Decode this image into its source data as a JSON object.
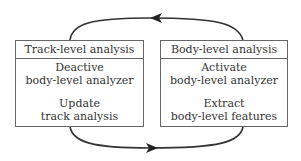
{
  "diagram": {
    "left_box": {
      "title": "Track-level analysis",
      "steps": [
        {
          "line1": "Deactive",
          "line2": "body-level analyzer"
        },
        {
          "line1": "Update",
          "line2": "track analysis"
        }
      ]
    },
    "right_box": {
      "title": "Body-level analysis",
      "steps": [
        {
          "line1": "Activate",
          "line2": "body-level analyzer"
        },
        {
          "line1": "Extract",
          "line2": "body-level features"
        }
      ]
    },
    "arrows": [
      {
        "from": "Body-level analysis",
        "to": "Track-level analysis",
        "position": "top",
        "direction": "left"
      },
      {
        "from": "Track-level analysis",
        "to": "Body-level analysis",
        "position": "bottom",
        "direction": "right"
      }
    ],
    "colors": {
      "line": "#333333",
      "border": "#666666",
      "text": "#333333"
    }
  }
}
